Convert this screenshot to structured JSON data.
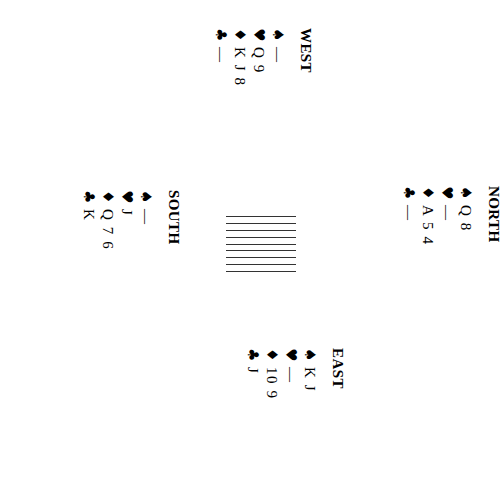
{
  "diagram": {
    "type": "bridge-deal",
    "suit_pips": {
      "spades": "♠",
      "hearts": "♥",
      "diamonds": "♦",
      "clubs": "♣"
    },
    "void_mark": "—",
    "ink_color": "#000000",
    "background_color": "#ffffff",
    "rotation_note": "whole deal rendered rotated 90 degrees clockwise"
  },
  "center_block": {
    "name": "hatched-rectangle",
    "line_count": 9,
    "line_color": "#333333"
  },
  "hands": {
    "north": {
      "label": "NORTH",
      "suits": [
        {
          "suit": "spades",
          "pip": "♠",
          "cards": "Q 8"
        },
        {
          "suit": "hearts",
          "pip": "♥",
          "cards": "—"
        },
        {
          "suit": "diamonds",
          "pip": "♦",
          "cards": "A 5 4"
        },
        {
          "suit": "clubs",
          "pip": "♣",
          "cards": "—"
        }
      ]
    },
    "east": {
      "label": "EAST",
      "suits": [
        {
          "suit": "spades",
          "pip": "♠",
          "cards": "K J"
        },
        {
          "suit": "hearts",
          "pip": "♥",
          "cards": "—"
        },
        {
          "suit": "diamonds",
          "pip": "♦",
          "cards": "10 9"
        },
        {
          "suit": "clubs",
          "pip": "♣",
          "cards": "J"
        }
      ]
    },
    "south": {
      "label": "SOUTH",
      "suits": [
        {
          "suit": "spades",
          "pip": "♠",
          "cards": "—"
        },
        {
          "suit": "hearts",
          "pip": "♥",
          "cards": "J"
        },
        {
          "suit": "diamonds",
          "pip": "♦",
          "cards": "Q 7 6"
        },
        {
          "suit": "clubs",
          "pip": "♣",
          "cards": "K"
        }
      ]
    },
    "west": {
      "label": "WEST",
      "suits": [
        {
          "suit": "spades",
          "pip": "♠",
          "cards": "—"
        },
        {
          "suit": "hearts",
          "pip": "♥",
          "cards": "Q 9"
        },
        {
          "suit": "diamonds",
          "pip": "♦",
          "cards": "K J 8"
        },
        {
          "suit": "clubs",
          "pip": "♣",
          "cards": "—"
        }
      ]
    }
  }
}
